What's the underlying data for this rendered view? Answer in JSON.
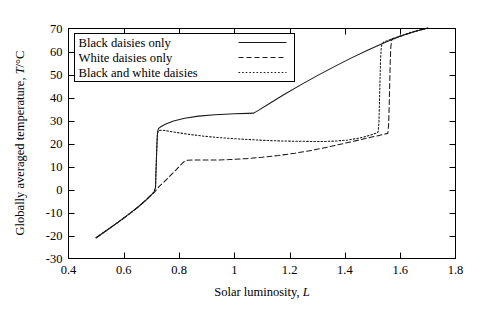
{
  "chart_data": {
    "type": "line",
    "title": "",
    "xlabel": "Solar luminosity, L",
    "xlabel_parts": {
      "text": "Solar luminosity, ",
      "symbol": "L"
    },
    "ylabel": "Globally averaged temperature, T/°C",
    "ylabel_parts": {
      "text": "Globally averaged temperature, ",
      "symbol": "T",
      "unit": "/°C"
    },
    "xlim": [
      0.4,
      1.8
    ],
    "ylim": [
      -30,
      70
    ],
    "xticks": [
      0.4,
      0.6,
      0.8,
      1.0,
      1.2,
      1.4,
      1.6,
      1.8
    ],
    "xtick_labels": [
      "0.4",
      "0.6",
      "0.8",
      "1",
      "1.2",
      "1.4",
      "1.6",
      "1.8"
    ],
    "yticks": [
      -30,
      -20,
      -10,
      0,
      10,
      20,
      30,
      40,
      50,
      60,
      70
    ],
    "ytick_labels": [
      "-30",
      "-20",
      "-10",
      "0",
      "10",
      "20",
      "30",
      "40",
      "50",
      "60",
      "70"
    ],
    "grid": false,
    "legend_position": "upper-left",
    "legend_entries": [
      {
        "label": "Black daisies only",
        "style": "solid"
      },
      {
        "label": "White daisies only",
        "style": "dashed"
      },
      {
        "label": "Black and white daisies",
        "style": "dotted"
      }
    ],
    "series": [
      {
        "name": "Black daisies only",
        "style": "solid",
        "dasharray": "none",
        "points": [
          [
            0.5,
            -21.0
          ],
          [
            0.54,
            -17.6
          ],
          [
            0.58,
            -14.2
          ],
          [
            0.62,
            -10.6
          ],
          [
            0.65,
            -7.8
          ],
          [
            0.68,
            -4.6
          ],
          [
            0.7,
            -2.3
          ],
          [
            0.71,
            -1.0
          ],
          [
            0.715,
            1.0
          ],
          [
            0.716,
            6.0
          ],
          [
            0.718,
            13.0
          ],
          [
            0.72,
            20.0
          ],
          [
            0.722,
            25.0
          ],
          [
            0.726,
            26.6
          ],
          [
            0.735,
            27.4
          ],
          [
            0.75,
            28.4
          ],
          [
            0.78,
            29.8
          ],
          [
            0.82,
            31.0
          ],
          [
            0.87,
            31.9
          ],
          [
            0.93,
            32.5
          ],
          [
            1.0,
            32.9
          ],
          [
            1.05,
            33.1
          ],
          [
            1.07,
            33.2
          ],
          [
            1.09,
            34.6
          ],
          [
            1.13,
            37.6
          ],
          [
            1.18,
            41.3
          ],
          [
            1.24,
            45.5
          ],
          [
            1.3,
            49.5
          ],
          [
            1.36,
            53.3
          ],
          [
            1.42,
            57.0
          ],
          [
            1.48,
            60.4
          ],
          [
            1.54,
            63.7
          ],
          [
            1.6,
            66.6
          ],
          [
            1.65,
            68.6
          ],
          [
            1.69,
            69.9
          ],
          [
            1.7,
            70.2
          ]
        ]
      },
      {
        "name": "White daisies only",
        "style": "dashed",
        "dasharray": "5,3",
        "points": [
          [
            0.5,
            -21.0
          ],
          [
            0.54,
            -17.6
          ],
          [
            0.58,
            -14.2
          ],
          [
            0.62,
            -10.6
          ],
          [
            0.65,
            -7.8
          ],
          [
            0.68,
            -4.6
          ],
          [
            0.7,
            -2.3
          ],
          [
            0.712,
            -1.0
          ],
          [
            0.73,
            1.6
          ],
          [
            0.75,
            3.8
          ],
          [
            0.77,
            6.2
          ],
          [
            0.79,
            8.6
          ],
          [
            0.805,
            10.6
          ],
          [
            0.818,
            12.1
          ],
          [
            0.83,
            12.7
          ],
          [
            0.85,
            12.8
          ],
          [
            0.88,
            12.8
          ],
          [
            0.93,
            12.8
          ],
          [
            0.98,
            13.0
          ],
          [
            1.04,
            13.4
          ],
          [
            1.1,
            14.0
          ],
          [
            1.16,
            14.8
          ],
          [
            1.22,
            15.8
          ],
          [
            1.28,
            17.0
          ],
          [
            1.34,
            18.5
          ],
          [
            1.4,
            20.1
          ],
          [
            1.45,
            21.5
          ],
          [
            1.49,
            22.6
          ],
          [
            1.52,
            23.4
          ],
          [
            1.545,
            24.1
          ],
          [
            1.555,
            24.4
          ],
          [
            1.558,
            28.0
          ],
          [
            1.56,
            36.0
          ],
          [
            1.562,
            46.0
          ],
          [
            1.564,
            56.0
          ],
          [
            1.566,
            62.0
          ],
          [
            1.57,
            65.5
          ],
          [
            1.6,
            66.6
          ],
          [
            1.65,
            68.6
          ],
          [
            1.69,
            69.9
          ],
          [
            1.7,
            70.2
          ]
        ]
      },
      {
        "name": "Black and white daisies",
        "style": "dotted",
        "dasharray": "1.6,2.0",
        "points": [
          [
            0.5,
            -21.0
          ],
          [
            0.54,
            -17.6
          ],
          [
            0.58,
            -14.2
          ],
          [
            0.62,
            -10.6
          ],
          [
            0.65,
            -7.8
          ],
          [
            0.68,
            -4.6
          ],
          [
            0.7,
            -2.3
          ],
          [
            0.71,
            -1.0
          ],
          [
            0.715,
            1.0
          ],
          [
            0.716,
            6.0
          ],
          [
            0.718,
            13.0
          ],
          [
            0.72,
            20.0
          ],
          [
            0.722,
            24.5
          ],
          [
            0.728,
            25.7
          ],
          [
            0.74,
            25.8
          ],
          [
            0.76,
            25.4
          ],
          [
            0.79,
            24.8
          ],
          [
            0.83,
            24.1
          ],
          [
            0.88,
            23.3
          ],
          [
            0.94,
            22.6
          ],
          [
            1.0,
            22.1
          ],
          [
            1.07,
            21.6
          ],
          [
            1.14,
            21.2
          ],
          [
            1.21,
            21.0
          ],
          [
            1.28,
            20.9
          ],
          [
            1.33,
            20.9
          ],
          [
            1.37,
            21.1
          ],
          [
            1.41,
            21.5
          ],
          [
            1.45,
            22.3
          ],
          [
            1.48,
            23.2
          ],
          [
            1.5,
            24.0
          ],
          [
            1.515,
            24.6
          ],
          [
            1.52,
            25.0
          ],
          [
            1.523,
            29.0
          ],
          [
            1.525,
            38.0
          ],
          [
            1.527,
            48.0
          ],
          [
            1.529,
            57.0
          ],
          [
            1.532,
            62.5
          ],
          [
            1.54,
            64.1
          ],
          [
            1.58,
            65.9
          ],
          [
            1.63,
            68.0
          ],
          [
            1.67,
            69.4
          ],
          [
            1.7,
            70.2
          ]
        ]
      }
    ]
  }
}
